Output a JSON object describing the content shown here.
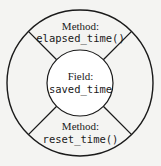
{
  "diagram": {
    "top": {
      "kind": "Method:",
      "name": "elapsed_time()"
    },
    "center": {
      "kind": "Field:",
      "name": "saved_time"
    },
    "bottom": {
      "kind": "Method:",
      "name": "reset_time()"
    },
    "colors": {
      "background": "#f4f4f2",
      "stroke": "#1a1a1a",
      "inner_fill": "#ffffff"
    }
  }
}
